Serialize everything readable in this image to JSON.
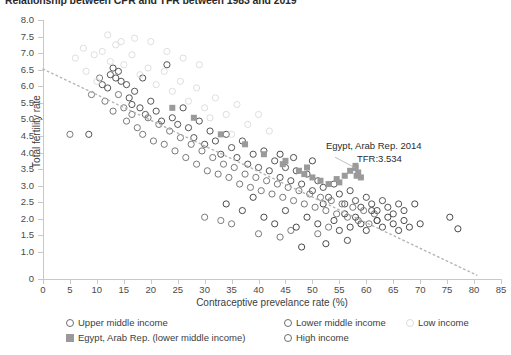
{
  "chart_data": {
    "type": "scatter",
    "title": "Relationship between CPR and TFR between 1983 and 2019",
    "xlabel": "Contraceptive prevelance rate (%)",
    "ylabel": "Total fertility rate",
    "xlim": [
      0,
      85
    ],
    "ylim": [
      0,
      8
    ],
    "grid": false,
    "legend_position": "bottom",
    "xticks": [
      "0",
      "5",
      "10",
      "15",
      "20",
      "25",
      "30",
      "35",
      "40",
      "45",
      "50",
      "55",
      "60",
      "65",
      "70",
      "75",
      "80",
      "85"
    ],
    "yticks": [
      "0",
      "1.0",
      "1.5",
      "2.0",
      "2.5",
      "3.0",
      "3.5",
      "4.0",
      "4.5",
      "5.0",
      "5.5",
      "6.0",
      "6.5",
      "7.0",
      "7.5",
      "8.0"
    ],
    "ytick_values": [
      0,
      1.0,
      1.5,
      2.0,
      2.5,
      3.0,
      3.5,
      4.0,
      4.5,
      5.0,
      5.5,
      6.0,
      6.5,
      7.0,
      7.5,
      8.0
    ],
    "annotations": [
      {
        "text": "Egypt, Arab Rep. 2014",
        "x": 56.5,
        "y": 3.85
      },
      {
        "text": "TFR:3.534",
        "x": 62.0,
        "y": 3.45
      }
    ],
    "trendline": {
      "style": "dotted",
      "color": "#b5b5b5",
      "x0": 0.0,
      "y0": 6.52,
      "x1": 80.5,
      "y1": 0.3
    },
    "legend": [
      {
        "label": "Upper middle income",
        "marker": "circle",
        "color": "#6e6e6e"
      },
      {
        "label": "Lower middle income",
        "marker": "circle",
        "color": "#6e6e6e"
      },
      {
        "label": "Low income",
        "marker": "circle-faint",
        "color": "#dcdcdc"
      },
      {
        "label": "Egypt, Arab Rep. (lower middle income)",
        "marker": "square",
        "color": "#9a9a9a"
      },
      {
        "label": "High income",
        "marker": "circle",
        "color": "#6e6e6e"
      }
    ],
    "series": [
      {
        "name": "Upper middle income",
        "marker": "circle",
        "color": "#555555",
        "points": [
          [
            8.5,
            4.55
          ],
          [
            11.0,
            6.05
          ],
          [
            12.0,
            5.95
          ],
          [
            12.5,
            6.35
          ],
          [
            13.0,
            6.55
          ],
          [
            13.5,
            6.25
          ],
          [
            14.0,
            6.45
          ],
          [
            14.5,
            6.15
          ],
          [
            15.5,
            6.05
          ],
          [
            16.0,
            5.65
          ],
          [
            16.5,
            5.45
          ],
          [
            17.0,
            5.85
          ],
          [
            18.0,
            5.35
          ],
          [
            18.5,
            6.25
          ],
          [
            19.0,
            5.15
          ],
          [
            20.0,
            5.55
          ],
          [
            21.0,
            5.25
          ],
          [
            22.0,
            4.95
          ],
          [
            23.0,
            6.65
          ],
          [
            24.0,
            5.05
          ],
          [
            25.0,
            4.85
          ],
          [
            26.0,
            5.35
          ],
          [
            27.0,
            4.75
          ],
          [
            28.0,
            4.45
          ],
          [
            29.0,
            4.95
          ],
          [
            30.0,
            4.25
          ],
          [
            31.0,
            4.65
          ],
          [
            32.0,
            4.35
          ],
          [
            33.0,
            3.95
          ],
          [
            34.0,
            4.55
          ],
          [
            35.0,
            4.15
          ],
          [
            36.0,
            3.85
          ],
          [
            37.0,
            4.35
          ],
          [
            38.0,
            3.65
          ],
          [
            39.0,
            3.95
          ],
          [
            40.0,
            3.55
          ],
          [
            41.0,
            4.05
          ],
          [
            42.0,
            3.45
          ],
          [
            43.0,
            3.75
          ],
          [
            44.0,
            3.25
          ],
          [
            45.0,
            3.55
          ],
          [
            46.0,
            3.15
          ],
          [
            47.0,
            3.45
          ],
          [
            48.0,
            3.05
          ],
          [
            49.0,
            3.35
          ],
          [
            50.0,
            2.85
          ],
          [
            51.0,
            3.15
          ],
          [
            52.0,
            2.95
          ],
          [
            53.0,
            2.65
          ],
          [
            54.0,
            3.05
          ],
          [
            55.0,
            2.75
          ],
          [
            56.0,
            2.45
          ],
          [
            57.0,
            2.85
          ],
          [
            58.0,
            2.55
          ],
          [
            59.0,
            2.35
          ],
          [
            60.0,
            2.65
          ],
          [
            61.0,
            2.45
          ],
          [
            62.0,
            2.25
          ],
          [
            63.0,
            2.55
          ],
          [
            64.0,
            2.35
          ],
          [
            65.0,
            2.15
          ],
          [
            66.0,
            2.45
          ],
          [
            67.0,
            2.25
          ]
        ]
      },
      {
        "name": "Lower middle income",
        "marker": "circle",
        "color": "#7a7a7a",
        "points": [
          [
            5.0,
            4.55
          ],
          [
            9.0,
            5.75
          ],
          [
            10.5,
            6.25
          ],
          [
            11.5,
            5.55
          ],
          [
            13.0,
            5.25
          ],
          [
            14.0,
            5.75
          ],
          [
            15.0,
            5.35
          ],
          [
            15.5,
            4.95
          ],
          [
            16.5,
            5.15
          ],
          [
            17.5,
            4.75
          ],
          [
            18.5,
            4.55
          ],
          [
            19.5,
            5.05
          ],
          [
            20.5,
            4.35
          ],
          [
            21.5,
            4.85
          ],
          [
            22.5,
            4.25
          ],
          [
            23.5,
            4.65
          ],
          [
            24.5,
            4.05
          ],
          [
            25.5,
            4.45
          ],
          [
            26.5,
            3.85
          ],
          [
            27.5,
            4.25
          ],
          [
            28.5,
            3.65
          ],
          [
            29.5,
            4.05
          ],
          [
            30.5,
            3.45
          ],
          [
            31.5,
            3.85
          ],
          [
            32.5,
            3.35
          ],
          [
            33.5,
            3.65
          ],
          [
            34.5,
            3.25
          ],
          [
            35.5,
            3.55
          ],
          [
            36.5,
            3.05
          ],
          [
            37.5,
            3.35
          ],
          [
            38.5,
            2.95
          ],
          [
            39.5,
            3.25
          ],
          [
            40.5,
            2.85
          ],
          [
            41.5,
            3.15
          ],
          [
            42.5,
            2.75
          ],
          [
            43.5,
            3.05
          ],
          [
            44.5,
            2.65
          ],
          [
            45.5,
            2.95
          ],
          [
            46.5,
            2.55
          ],
          [
            47.5,
            2.85
          ],
          [
            48.5,
            2.45
          ],
          [
            49.5,
            2.75
          ],
          [
            50.5,
            2.35
          ],
          [
            51.5,
            2.65
          ],
          [
            52.5,
            2.25
          ],
          [
            53.5,
            2.55
          ],
          [
            54.5,
            2.15
          ],
          [
            55.5,
            2.45
          ],
          [
            56.5,
            2.05
          ],
          [
            57.5,
            2.35
          ],
          [
            58.5,
            1.95
          ],
          [
            59.5,
            2.25
          ],
          [
            60.5,
            1.85
          ],
          [
            61.5,
            2.15
          ],
          [
            62.0,
            1.95
          ],
          [
            30.0,
            2.05
          ],
          [
            33.0,
            1.95
          ],
          [
            35.0,
            1.85
          ],
          [
            40.0,
            1.55
          ],
          [
            44.0,
            1.45
          ],
          [
            46.0,
            1.65
          ],
          [
            51.0,
            1.55
          ],
          [
            53.0,
            1.75
          ]
        ]
      },
      {
        "name": "Low income",
        "marker": "circle-faint",
        "color": "#dadada",
        "points": [
          [
            6.0,
            6.85
          ],
          [
            7.5,
            7.15
          ],
          [
            8.0,
            6.45
          ],
          [
            9.5,
            6.95
          ],
          [
            10.0,
            6.15
          ],
          [
            11.0,
            7.05
          ],
          [
            12.5,
            6.75
          ],
          [
            13.5,
            7.25
          ],
          [
            15.0,
            6.65
          ],
          [
            16.5,
            6.95
          ],
          [
            18.0,
            6.35
          ],
          [
            19.5,
            6.55
          ],
          [
            21.0,
            6.05
          ],
          [
            22.5,
            6.45
          ],
          [
            24.0,
            5.85
          ],
          [
            25.5,
            6.15
          ],
          [
            27.0,
            5.55
          ],
          [
            28.5,
            5.95
          ],
          [
            30.0,
            5.35
          ],
          [
            32.0,
            5.65
          ],
          [
            34.0,
            5.15
          ],
          [
            36.0,
            5.45
          ],
          [
            38.0,
            4.85
          ],
          [
            40.0,
            5.15
          ],
          [
            42.0,
            4.65
          ],
          [
            17.0,
            7.45
          ],
          [
            20.0,
            7.35
          ],
          [
            23.0,
            7.05
          ],
          [
            26.0,
            6.85
          ],
          [
            29.0,
            6.65
          ],
          [
            31.0,
            5.05
          ],
          [
            35.0,
            4.55
          ],
          [
            12.0,
            7.55
          ],
          [
            14.5,
            7.35
          ]
        ]
      },
      {
        "name": "High income",
        "marker": "circle",
        "color": "#4a4a4a",
        "points": [
          [
            41.0,
            2.05
          ],
          [
            43.0,
            1.85
          ],
          [
            45.0,
            2.25
          ],
          [
            47.0,
            1.75
          ],
          [
            49.0,
            2.05
          ],
          [
            51.0,
            1.85
          ],
          [
            52.0,
            2.45
          ],
          [
            54.0,
            1.95
          ],
          [
            55.0,
            1.65
          ],
          [
            56.0,
            2.15
          ],
          [
            57.0,
            1.75
          ],
          [
            58.0,
            2.05
          ],
          [
            59.0,
            1.85
          ],
          [
            60.0,
            1.65
          ],
          [
            61.0,
            2.25
          ],
          [
            62.0,
            1.95
          ],
          [
            63.0,
            1.75
          ],
          [
            64.0,
            2.05
          ],
          [
            65.0,
            1.85
          ],
          [
            66.0,
            1.65
          ],
          [
            67.0,
            1.95
          ],
          [
            68.0,
            1.75
          ],
          [
            69.0,
            2.45
          ],
          [
            70.0,
            1.85
          ],
          [
            75.5,
            2.05
          ],
          [
            77.0,
            1.7
          ],
          [
            34.0,
            2.45
          ],
          [
            37.0,
            2.25
          ],
          [
            39.0,
            2.65
          ],
          [
            48.0,
            1.15
          ],
          [
            52.5,
            1.25
          ],
          [
            56.5,
            1.35
          ],
          [
            44.0,
            3.95
          ],
          [
            46.5,
            3.85
          ],
          [
            50.0,
            3.75
          ]
        ]
      },
      {
        "name": "Egypt, Arab Rep. (lower middle income)",
        "marker": "square",
        "color": "#9a9a9a",
        "points": [
          [
            24.0,
            5.35
          ],
          [
            28.0,
            5.05
          ],
          [
            33.0,
            4.55
          ],
          [
            37.5,
            4.25
          ],
          [
            41.0,
            3.95
          ],
          [
            44.5,
            3.65
          ],
          [
            47.5,
            3.45
          ],
          [
            48.5,
            3.35
          ],
          [
            50.0,
            3.25
          ],
          [
            51.5,
            3.15
          ],
          [
            53.0,
            3.05
          ],
          [
            54.5,
            3.2
          ],
          [
            56.0,
            3.3
          ],
          [
            57.0,
            3.45
          ],
          [
            58.0,
            3.534
          ],
          [
            58.5,
            3.4
          ],
          [
            59.0,
            3.25
          ],
          [
            45.0,
            3.75
          ],
          [
            49.0,
            3.55
          ],
          [
            55.0,
            3.1
          ],
          [
            58.0,
            3.6
          ],
          [
            58.2,
            3.3
          ]
        ]
      }
    ]
  }
}
